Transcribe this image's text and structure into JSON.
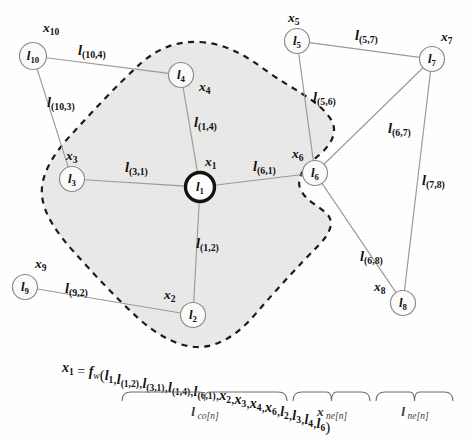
{
  "figure": {
    "colors": {
      "region_fill": "#e9e9e7",
      "region_stroke": "#1a1a1a",
      "edge": "#9a9a9a",
      "node_fill": "#fbfbfa",
      "node_stroke": "#8a8a8a",
      "root_node_stroke": "#111111",
      "text": "#101010"
    },
    "nodes": [
      {
        "id": "n1",
        "node_label": "l",
        "node_sub": "1",
        "state_label": "x",
        "state_sub": "1",
        "cx": 200,
        "cy": 187,
        "r": 14.5,
        "root": true,
        "node_text_dx": 0,
        "state_x": 205,
        "state_y": 163
      },
      {
        "id": "n2",
        "node_label": "l",
        "node_sub": "2",
        "state_label": "x",
        "state_sub": "2",
        "cx": 193,
        "cy": 315,
        "r": 12.5,
        "root": false,
        "node_text_dx": 0,
        "state_x": 164,
        "state_y": 296
      },
      {
        "id": "n3",
        "node_label": "l",
        "node_sub": "3",
        "state_label": "x",
        "state_sub": "3",
        "cx": 72,
        "cy": 179,
        "r": 12.5,
        "root": false,
        "node_text_dx": 0,
        "state_x": 66,
        "state_y": 157
      },
      {
        "id": "n4",
        "node_label": "l",
        "node_sub": "4",
        "state_label": "x",
        "state_sub": "4",
        "cx": 181,
        "cy": 75,
        "r": 12.5,
        "root": false,
        "node_text_dx": 0,
        "state_x": 199,
        "state_y": 88
      },
      {
        "id": "n5",
        "node_label": "l",
        "node_sub": "5",
        "state_label": "x",
        "state_sub": "5",
        "cx": 297,
        "cy": 41,
        "r": 12.5,
        "root": false,
        "node_text_dx": 0,
        "state_x": 288,
        "state_y": 19
      },
      {
        "id": "n6",
        "node_label": "l",
        "node_sub": "6",
        "state_label": "x",
        "state_sub": "6",
        "cx": 315,
        "cy": 173,
        "r": 12.5,
        "root": false,
        "node_text_dx": 0,
        "state_x": 292,
        "state_y": 155
      },
      {
        "id": "n7",
        "node_label": "l",
        "node_sub": "7",
        "state_label": "x",
        "state_sub": "7",
        "cx": 432,
        "cy": 59,
        "r": 12.5,
        "root": false,
        "node_text_dx": 0,
        "state_x": 441,
        "state_y": 38
      },
      {
        "id": "n8",
        "node_label": "l",
        "node_sub": "8",
        "state_label": "x",
        "state_sub": "8",
        "cx": 403,
        "cy": 303,
        "r": 12.5,
        "root": false,
        "node_text_dx": 0,
        "state_x": 374,
        "state_y": 288
      },
      {
        "id": "n9",
        "node_label": "l",
        "node_sub": "9",
        "state_label": "x",
        "state_sub": "9",
        "cx": 25,
        "cy": 287,
        "r": 12.5,
        "root": false,
        "node_text_dx": 0,
        "state_x": 35,
        "state_y": 265
      },
      {
        "id": "n10",
        "node_label": "l",
        "node_sub": "10",
        "state_label": "x",
        "state_sub": "10",
        "cx": 33,
        "cy": 56,
        "r": 13.5,
        "root": false,
        "node_text_dx": 0,
        "state_x": 43,
        "state_y": 29
      }
    ],
    "edges": [
      {
        "from": "n10",
        "to": "n4",
        "label": "l",
        "sub": "(10,4)",
        "lx": 78,
        "ly": 52
      },
      {
        "from": "n10",
        "to": "n3",
        "label": "l",
        "sub": "(10,3)",
        "lx": 47,
        "ly": 104
      },
      {
        "from": "n3",
        "to": "n1",
        "label": "l",
        "sub": "(3,1)",
        "lx": 125,
        "ly": 169
      },
      {
        "from": "n4",
        "to": "n1",
        "label": "l",
        "sub": "(1,4)",
        "lx": 194,
        "ly": 124
      },
      {
        "from": "n1",
        "to": "n2",
        "label": "l",
        "sub": "(1,2)",
        "lx": 196,
        "ly": 245
      },
      {
        "from": "n6",
        "to": "n1",
        "label": "l",
        "sub": "(6,1)",
        "lx": 253,
        "ly": 168
      },
      {
        "from": "n9",
        "to": "n2",
        "label": "l",
        "sub": "(9,2)",
        "lx": 65,
        "ly": 290
      },
      {
        "from": "n5",
        "to": "n7",
        "label": "l",
        "sub": "(5,7)",
        "lx": 355,
        "ly": 37
      },
      {
        "from": "n5",
        "to": "n6",
        "label": "l",
        "sub": "(5,6)",
        "lx": 313,
        "ly": 99
      },
      {
        "from": "n6",
        "to": "n7",
        "label": "l",
        "sub": "(6,7)",
        "lx": 388,
        "ly": 130
      },
      {
        "from": "n7",
        "to": "n8",
        "label": "l",
        "sub": "(7,8)",
        "lx": 422,
        "ly": 182
      },
      {
        "from": "n6",
        "to": "n8",
        "label": "l",
        "sub": "(6,8)",
        "lx": 360,
        "ly": 258
      }
    ],
    "formula": {
      "lhs": "x",
      "lhs_sub": "1",
      "equals": "=",
      "fn": "f",
      "fn_sub": "w",
      "open_paren": "(",
      "close_paren": ")",
      "comma": ",",
      "l_co_terms": [
        {
          "base": "l",
          "sub": "1"
        },
        {
          "base": "l",
          "sub": "(1,2)"
        },
        {
          "base": "l",
          "sub": "(3,1)"
        },
        {
          "base": "l",
          "sub": "(1,4)"
        },
        {
          "base": "l",
          "sub": "(6,1)"
        }
      ],
      "x_ne_terms": [
        {
          "base": "x",
          "sub": "2"
        },
        {
          "base": "x",
          "sub": "3"
        },
        {
          "base": "x",
          "sub": "4"
        },
        {
          "base": "x",
          "sub": "6"
        }
      ],
      "l_ne_terms": [
        {
          "base": "l",
          "sub": "2"
        },
        {
          "base": "l",
          "sub": "3"
        },
        {
          "base": "l",
          "sub": "4"
        },
        {
          "base": "l",
          "sub": "6"
        }
      ]
    },
    "braces": [
      {
        "name": "l-co-brace",
        "base": "l",
        "sub": "co[n]",
        "x1": 122,
        "x2": 287,
        "label_x": 205,
        "label_y": 413
      },
      {
        "name": "x-ne-brace",
        "base": "x",
        "sub": "ne[n]",
        "x1": 293,
        "x2": 370,
        "label_x": 332,
        "label_y": 413
      },
      {
        "name": "l-ne-brace",
        "base": "l",
        "sub": "ne[n]",
        "x1": 376,
        "x2": 453,
        "label_x": 415,
        "label_y": 413
      }
    ],
    "region": {
      "name": "neighbourhood-region",
      "path": "M 200 42 C 228 44 246 56 268 72 C 292 89 318 100 330 118 C 340 132 330 146 318 156 C 306 166 296 176 300 188 C 305 201 318 205 327 214 C 335 222 330 234 318 246 C 300 264 276 290 252 318 C 234 338 214 348 196 347 C 176 346 156 334 138 318 C 116 298 92 272 74 252 C 56 232 44 214 42 196 C 40 176 52 156 70 136 C 92 112 118 84 140 64 C 160 46 180 41 200 42 Z"
    }
  }
}
